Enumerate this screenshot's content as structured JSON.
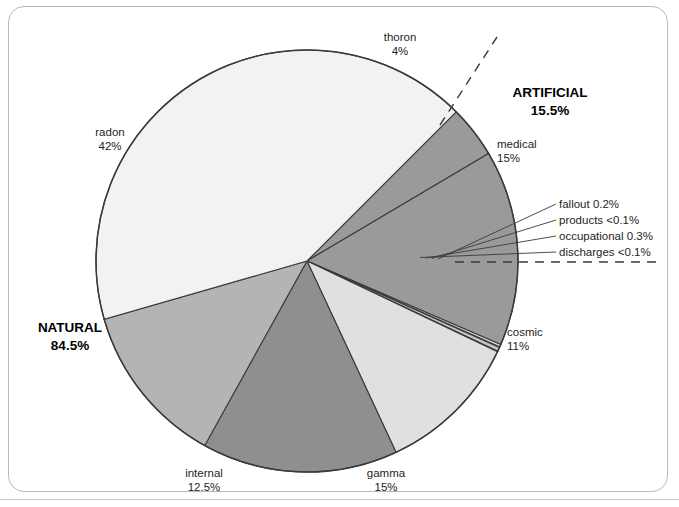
{
  "chart_data": {
    "type": "pie",
    "title": "",
    "subtitle": "",
    "xlabel": "",
    "ylabel": "",
    "legend_position": "none",
    "grid": false,
    "units": "percent of average annual radiation dose",
    "center": {
      "x": 307,
      "y": 261,
      "radius": 211
    },
    "start_angle_deg": -45,
    "direction": "clockwise",
    "categories": [
      "thoron",
      "medical",
      "fallout",
      "products",
      "occupational",
      "discharges",
      "cosmic",
      "gamma",
      "internal",
      "radon"
    ],
    "values": [
      4,
      15,
      0.2,
      0.05,
      0.3,
      0.05,
      11,
      15,
      12.5,
      42
    ],
    "slices": [
      {
        "name": "thoron",
        "value": 4,
        "value_label": "4%",
        "color": "#9a9a9a",
        "group": "NATURAL"
      },
      {
        "name": "medical",
        "value": 15,
        "value_label": "15%",
        "color": "#9a9a9a",
        "group": "ARTIFICIAL"
      },
      {
        "name": "fallout",
        "value": 0.2,
        "value_label": "0.2%",
        "color": "#d8d8d8",
        "group": "ARTIFICIAL"
      },
      {
        "name": "products",
        "value": 0.05,
        "value_label": "<0.1%",
        "color": "#ededed",
        "group": "ARTIFICIAL"
      },
      {
        "name": "occupational",
        "value": 0.3,
        "value_label": "0.3%",
        "color": "#c4c4c4",
        "group": "ARTIFICIAL"
      },
      {
        "name": "discharges",
        "value": 0.05,
        "value_label": "<0.1%",
        "color": "#ededed",
        "group": "ARTIFICIAL"
      },
      {
        "name": "cosmic",
        "value": 11,
        "value_label": "11%",
        "color": "#e0e0e0",
        "group": "NATURAL"
      },
      {
        "name": "gamma",
        "value": 15,
        "value_label": "15%",
        "color": "#8f8f8f",
        "group": "NATURAL"
      },
      {
        "name": "internal",
        "value": 12.5,
        "value_label": "12.5%",
        "color": "#b4b4b4",
        "group": "NATURAL"
      },
      {
        "name": "radon",
        "value": 42,
        "value_label": "42%",
        "color": "#f2f2f2",
        "group": "NATURAL"
      }
    ],
    "groups": [
      {
        "name": "NATURAL",
        "value": 84.5,
        "value_label": "84.5%"
      },
      {
        "name": "ARTIFICIAL",
        "value": 15.5,
        "value_label": "15.5%"
      }
    ],
    "annotations": [
      {
        "text": "dashed divider between NATURAL and ARTIFICIAL sectors",
        "style": "dashed"
      }
    ]
  },
  "labels": {
    "thoron": {
      "name": "thoron",
      "pct": "4%"
    },
    "medical": {
      "name": "medical",
      "pct": "15%"
    },
    "cosmic": {
      "name": "cosmic",
      "pct": "11%"
    },
    "gamma": {
      "name": "gamma",
      "pct": "15%"
    },
    "internal": {
      "name": "internal",
      "pct": "12.5%"
    },
    "radon": {
      "name": "radon",
      "pct": "42%"
    }
  },
  "callouts": [
    {
      "text": "fallout 0.2%"
    },
    {
      "text": "products <0.1%"
    },
    {
      "text": "occupational 0.3%"
    },
    {
      "text": "discharges <0.1%"
    }
  ],
  "groups": {
    "artificial": {
      "name": "ARTIFICIAL",
      "pct": "15.5%"
    },
    "natural": {
      "name": "NATURAL",
      "pct": "84.5%"
    }
  },
  "colors": {
    "frame_border": "#b9b9b9",
    "outline": "#3a3a3a",
    "text": "#231f20",
    "background": "#ffffff"
  }
}
